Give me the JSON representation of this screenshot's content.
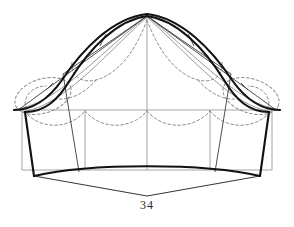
{
  "figure": {
    "caption": "34",
    "colors": {
      "outline_bold": "#111111",
      "construction_thin": "#3a3a3a",
      "grid_gray": "#9a9a9a",
      "dashed_gray": "#8a8a8a",
      "background": "#ffffff",
      "caption_text": "#2b2b2b"
    },
    "geometry": {
      "canvas": {
        "width": 294,
        "height": 227
      },
      "apex": {
        "x": 147,
        "y": 14
      },
      "waist_line_y": 110,
      "hem_line_y": 170,
      "left_edge_x": 22,
      "right_edge_x": 272,
      "center_x": 147,
      "grid_vertical_x": [
        22,
        85,
        147,
        210,
        272
      ],
      "point_bottom_v": {
        "x": 147,
        "y": 196
      },
      "bold_hem_left": {
        "x": 34,
        "y": 176
      },
      "bold_hem_right": {
        "x": 260,
        "y": 176
      },
      "bold_hem_dip_y": 166,
      "scallop_count_lower": 4,
      "scallop_dip_y": 126
    },
    "labels": {
      "figure_number": "34"
    },
    "elements": {
      "outer_bell_curve": "bold dome outline from left corner over apex to right corner",
      "inner_bell_curve": "second bold curve inset from the outer dome",
      "radial_lines": "thin straight lines from apex to side panels",
      "grid_rectangle": "light gray rectangle with four vertical divisions",
      "dashed_scallops_lower": "four dashed scallop arcs hanging from the waist line",
      "dashed_scallops_upper": "dashed scallop arcs following the dome",
      "dashed_side_ellipses": "dashed ellipse arcs at left and right shoulders",
      "hem_chevron": "two straight lines from the hem corners meeting at a lower vertex"
    }
  }
}
